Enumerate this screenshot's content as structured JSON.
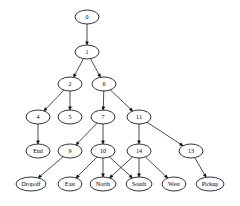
{
  "diagram": {
    "type": "directed-tree",
    "colors": {
      "background": "#ffffff",
      "stroke": "#000000",
      "text": "#000000"
    },
    "nodes": [
      {
        "id": "0",
        "label": "0"
      },
      {
        "id": "1",
        "label": "1"
      },
      {
        "id": "2",
        "label": "2"
      },
      {
        "id": "6",
        "label": "6"
      },
      {
        "id": "4",
        "label": "4"
      },
      {
        "id": "5",
        "label": "5"
      },
      {
        "id": "7",
        "label": "7"
      },
      {
        "id": "11",
        "label": "11"
      },
      {
        "id": "End",
        "label": "End"
      },
      {
        "id": "9",
        "label": "9"
      },
      {
        "id": "10",
        "label": "10"
      },
      {
        "id": "14",
        "label": "14"
      },
      {
        "id": "13",
        "label": "13"
      },
      {
        "id": "Dropoff",
        "label": "Dropoff"
      },
      {
        "id": "East",
        "label": "East"
      },
      {
        "id": "North",
        "label": "North"
      },
      {
        "id": "South",
        "label": "South"
      },
      {
        "id": "West",
        "label": "West"
      },
      {
        "id": "Pickup",
        "label": "Pickup"
      }
    ],
    "edges": [
      {
        "from": "0",
        "to": "1"
      },
      {
        "from": "1",
        "to": "2"
      },
      {
        "from": "1",
        "to": "6"
      },
      {
        "from": "2",
        "to": "4"
      },
      {
        "from": "2",
        "to": "5"
      },
      {
        "from": "6",
        "to": "7"
      },
      {
        "from": "6",
        "to": "11"
      },
      {
        "from": "4",
        "to": "End"
      },
      {
        "from": "7",
        "to": "9"
      },
      {
        "from": "7",
        "to": "10"
      },
      {
        "from": "11",
        "to": "14"
      },
      {
        "from": "11",
        "to": "13"
      },
      {
        "from": "9",
        "to": "Dropoff"
      },
      {
        "from": "10",
        "to": "East"
      },
      {
        "from": "10",
        "to": "North"
      },
      {
        "from": "10",
        "to": "South"
      },
      {
        "from": "14",
        "to": "North"
      },
      {
        "from": "14",
        "to": "South"
      },
      {
        "from": "14",
        "to": "West"
      },
      {
        "from": "13",
        "to": "Pickup"
      }
    ]
  }
}
